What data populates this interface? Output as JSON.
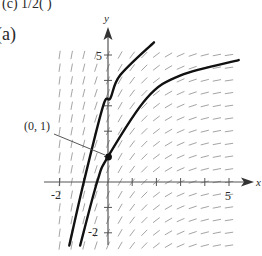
{
  "header": {
    "top_text": "(c)        1/2(                 )",
    "part_label": "(a)"
  },
  "chart_data": {
    "type": "line",
    "title": "",
    "xlabel": "x",
    "ylabel": "y",
    "xlim": [
      -2,
      5.5
    ],
    "ylim": [
      -3,
      5.5
    ],
    "x_ticks": [
      -2,
      -1,
      0,
      1,
      2,
      3,
      4,
      5
    ],
    "x_tick_labels": {
      "-2": "-2",
      "5": "5"
    },
    "y_ticks": [
      -2,
      -1,
      0,
      1,
      2,
      3,
      4,
      5
    ],
    "y_tick_labels": {
      "-2": "-2",
      "5": "5"
    },
    "grid": false,
    "slope_field": {
      "x_range": [
        -2,
        5
      ],
      "y_range": [
        -2.5,
        5
      ],
      "spacing": 0.5,
      "description": "slopes positive, steep for negative x, nearly flat for large x"
    },
    "series": [
      {
        "name": "solution curve 1",
        "points": [
          [
            -1.6,
            -2.5
          ],
          [
            -1.0,
            0
          ],
          [
            -0.2,
            3
          ],
          [
            0.1,
            3.3
          ],
          [
            0.5,
            4.2
          ],
          [
            1.9,
            5.5
          ]
        ]
      },
      {
        "name": "solution curve 2 (through (0,1))",
        "points": [
          [
            -1.15,
            -2.5
          ],
          [
            -0.45,
            0
          ],
          [
            0,
            1
          ],
          [
            1.6,
            3.3
          ],
          [
            3,
            4.2
          ],
          [
            5.4,
            4.8
          ]
        ]
      }
    ],
    "annotations": [
      {
        "text": "(0, 1)",
        "point": [
          0,
          1
        ],
        "marker": "filled-circle"
      }
    ],
    "colors": {
      "curve": "#111111",
      "axis": "#555555",
      "slope": "#9a9a9a"
    }
  }
}
